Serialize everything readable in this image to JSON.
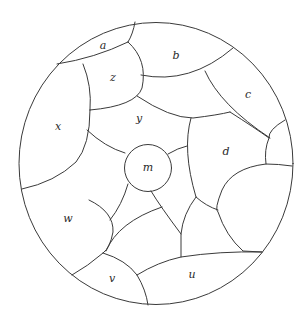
{
  "diagram": {
    "type": "planar-map",
    "outer_circle": {
      "cx": 156,
      "cy": 163.5,
      "rx": 137,
      "ry": 141
    },
    "inner_circle": {
      "cx": 148,
      "cy": 168,
      "r": 23.5
    },
    "stroke_color": "#3a3a3a",
    "labels": [
      {
        "id": "a",
        "text": "a",
        "x": 103,
        "y": 46
      },
      {
        "id": "b",
        "text": "b",
        "x": 176,
        "y": 56
      },
      {
        "id": "c",
        "text": "c",
        "x": 248,
        "y": 95
      },
      {
        "id": "z",
        "text": "z",
        "x": 113,
        "y": 78
      },
      {
        "id": "x",
        "text": "x",
        "x": 58,
        "y": 127
      },
      {
        "id": "y",
        "text": "y",
        "x": 139,
        "y": 119
      },
      {
        "id": "m",
        "text": "m",
        "x": 148,
        "y": 168
      },
      {
        "id": "d",
        "text": "d",
        "x": 226,
        "y": 152
      },
      {
        "id": "w",
        "text": "w",
        "x": 68,
        "y": 219
      },
      {
        "id": "v",
        "text": "v",
        "x": 112,
        "y": 279
      },
      {
        "id": "u",
        "text": "u",
        "x": 192,
        "y": 275
      }
    ]
  }
}
